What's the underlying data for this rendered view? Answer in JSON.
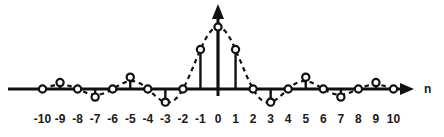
{
  "figure": {
    "title": "",
    "axis_name_x": "n",
    "axis_name_y": "",
    "line_color": "#111111",
    "marker_fill": "#ffffff",
    "marker_stroke": "#111111",
    "background": "#ffffff"
  },
  "chart_data": {
    "type": "line",
    "title": "",
    "xlabel": "n",
    "ylabel": "",
    "grid": false,
    "legend": null,
    "xlim": [
      -10.9,
      10.9
    ],
    "ylim": [
      -0.33,
      1.08
    ],
    "x": [
      -10,
      -9,
      -8,
      -7,
      -6,
      -5,
      -4,
      -3,
      -2,
      -1,
      0,
      1,
      2,
      3,
      4,
      5,
      6,
      7,
      8,
      9,
      10
    ],
    "tick_labels": [
      "-10",
      "-9",
      "-8",
      "-7",
      "-6",
      "-5",
      "-4",
      "-3",
      "-2",
      "-1",
      "0",
      "1",
      "2",
      "3",
      "4",
      "5",
      "6",
      "7",
      "8",
      "9",
      "10"
    ],
    "series": [
      {
        "name": "sinc",
        "style": "stem-with-dashed-envelope",
        "values": [
          0,
          0.104,
          0,
          -0.131,
          0,
          0.191,
          0,
          -0.212,
          0,
          0.637,
          1.0,
          0.637,
          0,
          -0.212,
          0,
          0.191,
          0,
          -0.131,
          0,
          0.104,
          0
        ]
      }
    ],
    "annotations": []
  }
}
